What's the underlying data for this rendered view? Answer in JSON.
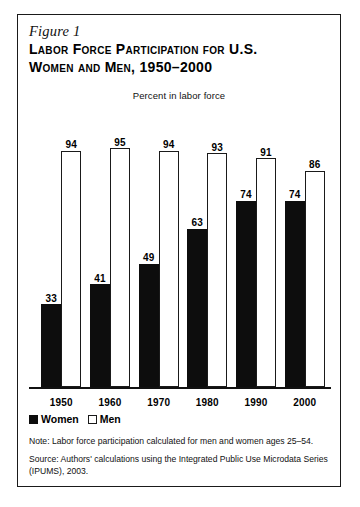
{
  "figure": {
    "label": "Figure 1",
    "title_line1": "Labor Force Participation for U.S.",
    "title_line2": "Women and Men, 1950–2000",
    "subtitle": "Percent in labor force"
  },
  "legend": {
    "women_label": "Women",
    "men_label": "Men",
    "women_color": "#0d0d0d",
    "men_color": "#ffffff",
    "men_border_color": "#1a1a1a"
  },
  "notes": {
    "note": "Note: Labor force participation calculated for men and women ages 25–54.",
    "source": "Source: Authors' calculations using the Integrated Public Use Microdata Series (IPUMS), 2003."
  },
  "chart_data": {
    "type": "bar",
    "title": "Labor Force Participation for U.S. Women and Men, 1950–2000",
    "subtitle": "Percent in labor force",
    "categories": [
      "1950",
      "1960",
      "1970",
      "1980",
      "1990",
      "2000"
    ],
    "series": [
      {
        "name": "Women",
        "values": [
          33,
          41,
          49,
          63,
          74,
          74
        ],
        "color": "#0d0d0d"
      },
      {
        "name": "Men",
        "values": [
          94,
          95,
          94,
          93,
          91,
          86
        ],
        "color": "#ffffff"
      }
    ],
    "xlabel": "",
    "ylabel": "Percent in labor force",
    "ylim": [
      0,
      100
    ],
    "grid": false,
    "legend_position": "bottom-left",
    "axis_visible": {
      "x": true,
      "y": false
    },
    "data_labels": true
  }
}
